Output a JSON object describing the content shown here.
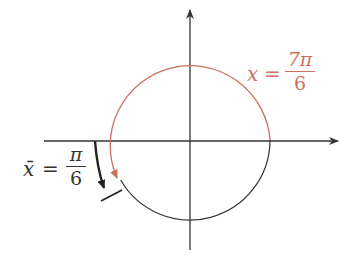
{
  "diagram": {
    "type": "unit-circle-angle",
    "colors": {
      "red": "#c9705f",
      "black": "#333333"
    },
    "label_red": {
      "var": "x",
      "eq": "=",
      "num": "7π",
      "den": "6"
    },
    "label_black": {
      "var": "x̄",
      "eq": "=",
      "num": "π",
      "den": "6"
    }
  }
}
